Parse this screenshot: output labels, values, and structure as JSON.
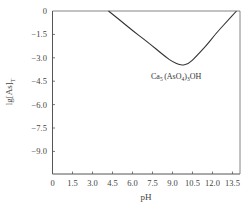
{
  "chart_data": {
    "type": "line",
    "title": "",
    "xlabel": "pH",
    "ylabel": "lg[As]T",
    "ylabel_main": "lg[As]",
    "ylabel_sub": "T",
    "xlim": [
      0,
      14.1
    ],
    "ylim": [
      -10.4,
      0
    ],
    "x_ticks": [
      0,
      1.5,
      3.0,
      4.5,
      6.0,
      7.5,
      9.0,
      10.5,
      12.0,
      13.5
    ],
    "x_tick_labels": [
      "0",
      "1.5",
      "3.0",
      "4.5",
      "6.0",
      "7.5",
      "9.0",
      "10.5",
      "12.0",
      "13.5"
    ],
    "y_ticks": [
      0,
      -1.5,
      -3.0,
      -4.5,
      -6.0,
      -7.5,
      -9.0
    ],
    "y_tick_labels": [
      "0",
      "-1.5",
      "-3.0",
      "-4.5",
      "-6.0",
      "-7.5",
      "-9.0"
    ],
    "grid": false,
    "legend": null,
    "series": [
      {
        "name": "Ca5(AsO4)3OH",
        "x": [
          4.2,
          5.0,
          6.0,
          7.0,
          7.5,
          8.0,
          8.5,
          9.0,
          9.6,
          10.2,
          10.8,
          11.5,
          12.2,
          13.0,
          13.8
        ],
        "y": [
          0,
          -0.55,
          -1.25,
          -1.9,
          -2.25,
          -2.6,
          -2.95,
          -3.25,
          -3.5,
          -3.4,
          -2.9,
          -2.25,
          -1.5,
          -0.75,
          0
        ]
      }
    ],
    "annotations": [
      {
        "text": "Ca5(AsO4)3OH",
        "x": 11.2,
        "y": -4.3
      }
    ]
  },
  "annotation_label": {
    "ca": "Ca",
    "ca_sub": "5",
    "mid": "(AsO",
    "o_sub": "4",
    "close": ")",
    "close_sub": "3",
    "tail": "OH"
  }
}
